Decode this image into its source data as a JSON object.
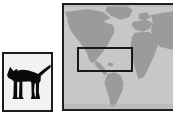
{
  "scene": {
    "title": "Cat image and world map with region-of-interest",
    "background_color": "#ffffff",
    "width": 173,
    "height": 119
  },
  "panels": [
    {
      "id": "cat-panel",
      "name": "cat-image-panel",
      "alt": "Black cat silhouette standing in profile, facing left, tail raised",
      "subject": "cat",
      "border_color": "#1c1c1c",
      "background_color": "#f2f2f2",
      "silhouette_color": "#0a0a0a",
      "x": 2,
      "y": 52,
      "width": 51,
      "height": 60
    },
    {
      "id": "map-panel",
      "name": "world-map-panel",
      "alt": "Grayscale world map showing North America, South America, Europe, Africa and Asia",
      "subject": "world map",
      "border_color": "#1f1f1f",
      "ocean_color": "#c7c7c7",
      "land_color": "#9b9b9b",
      "x": 62,
      "y": 3,
      "width": 115,
      "height": 108
    }
  ],
  "roi": {
    "name": "region-of-interest-rectangle",
    "label": "North America",
    "stroke_color": "#181818",
    "stroke_width": 2,
    "x": 13,
    "y": 42,
    "width": 56,
    "height": 25
  }
}
